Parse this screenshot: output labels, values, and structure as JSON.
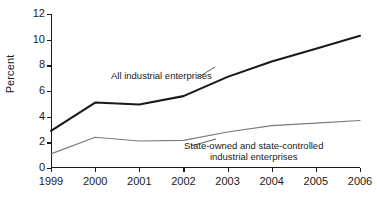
{
  "chart_data": {
    "type": "line",
    "title": "",
    "xlabel": "",
    "ylabel": "Percent",
    "categories": [
      "1999",
      "2000",
      "2001",
      "2002",
      "2003",
      "2004",
      "2005",
      "2006"
    ],
    "x": [
      1999,
      2000,
      2001,
      2002,
      2003,
      2004,
      2005,
      2006
    ],
    "ylim": [
      0,
      12
    ],
    "yticks": [
      0,
      2,
      4,
      6,
      8,
      10,
      12
    ],
    "ytick_labels": [
      "0",
      "2",
      "4",
      "6",
      "8",
      "10",
      "12"
    ],
    "xtick_labels": [
      "1999",
      "2000",
      "2001",
      "2002",
      "2003",
      "2004",
      "2005",
      "2006"
    ],
    "grid": false,
    "legend": "inline-annotations",
    "series": [
      {
        "name": "All industrial enterprises",
        "color": "#1a1a1a",
        "width": 2.1,
        "values": [
          2.9,
          5.1,
          4.95,
          5.6,
          7.1,
          8.3,
          9.3,
          10.3
        ]
      },
      {
        "name": "State-owned and state-controlled industrial enterprises",
        "color": "#7a7a7a",
        "width": 1.1,
        "values": [
          1.1,
          2.4,
          2.1,
          2.15,
          2.8,
          3.3,
          3.5,
          3.7
        ]
      }
    ],
    "annotations": [
      {
        "id": "all",
        "text": "All industrial enterprises",
        "line2": ""
      },
      {
        "id": "soe",
        "text": "State-owned and state-controlled",
        "line2": "industrial enterprises"
      }
    ]
  }
}
